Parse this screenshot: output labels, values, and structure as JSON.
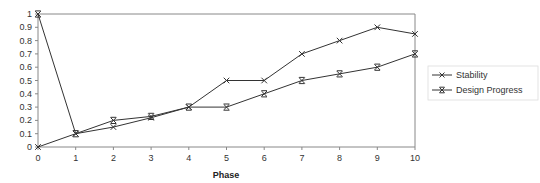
{
  "chart_data": {
    "type": "line",
    "title": "",
    "xlabel": "Phase",
    "ylabel": "",
    "x": [
      0,
      1,
      2,
      3,
      4,
      5,
      6,
      7,
      8,
      9,
      10
    ],
    "xticks": [
      "0",
      "1",
      "2",
      "3",
      "4",
      "5",
      "6",
      "7",
      "8",
      "9",
      "10"
    ],
    "yticks": [
      "0",
      "0.1",
      "0.2",
      "0.3",
      "0.4",
      "0.5",
      "0.6",
      "0.7",
      "0.8",
      "0.9",
      "1"
    ],
    "ylim": [
      0,
      1
    ],
    "xlim": [
      0,
      10
    ],
    "grid": false,
    "legend_position": "right",
    "series": [
      {
        "name": "Stability",
        "marker": "x",
        "color": "#333333",
        "values": [
          0,
          0.1,
          0.15,
          0.22,
          0.3,
          0.5,
          0.5,
          0.7,
          0.8,
          0.9,
          0.85
        ]
      },
      {
        "name": "Design Progress",
        "marker": "x-bar",
        "color": "#333333",
        "values": [
          1,
          0.1,
          0.2,
          0.23,
          0.3,
          0.3,
          0.4,
          0.5,
          0.55,
          0.6,
          0.7
        ]
      }
    ]
  },
  "legend": {
    "items": [
      {
        "label": "Stability"
      },
      {
        "label": "Design Progress"
      }
    ]
  }
}
